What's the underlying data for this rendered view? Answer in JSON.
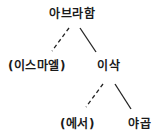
{
  "diagram": {
    "type": "family-tree",
    "nodes": {
      "abraham": {
        "label": "아브라함"
      },
      "ishmael": {
        "label": "(이스마엘)"
      },
      "isaac": {
        "label": "이삭"
      },
      "esau": {
        "label": "(에서)"
      },
      "jacob": {
        "label": "야곱"
      }
    },
    "edges": [
      {
        "from": "abraham",
        "to": "ishmael",
        "style": "dashed"
      },
      {
        "from": "abraham",
        "to": "isaac",
        "style": "solid"
      },
      {
        "from": "isaac",
        "to": "esau",
        "style": "dashed"
      },
      {
        "from": "isaac",
        "to": "jacob",
        "style": "solid"
      }
    ],
    "line_color": "#222222"
  }
}
